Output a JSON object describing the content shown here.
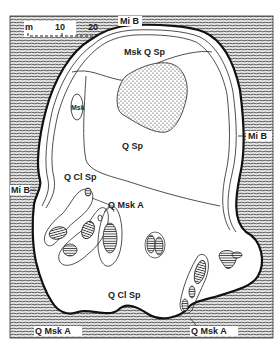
{
  "map": {
    "scale_bar": {
      "unit": "m",
      "ticks": [
        "10",
        "20"
      ]
    },
    "labels": {
      "top_boundary": "Mi B",
      "right_boundary": "Mi B",
      "left_boundary": "Mi B",
      "upper_zone": "Msk Q Sp",
      "small_ellipse": "Msk",
      "central_zone": "Q Sp",
      "left_zone": "Q Cl Sp",
      "islands": "Q Msk A",
      "lower_zone": "Q Cl Sp",
      "bottom_left": "Q Msk A",
      "bottom_right": "Q Msk A"
    },
    "legend_patterns": {
      "hatched": "host rock (Mi B)",
      "stippled": "core zone",
      "white": "pegmatite zones"
    },
    "colors": {
      "ink": "#1a1a1a",
      "hatch": "#555555",
      "paper": "#ffffff",
      "hatch_bg": "#d8d8d8"
    }
  }
}
